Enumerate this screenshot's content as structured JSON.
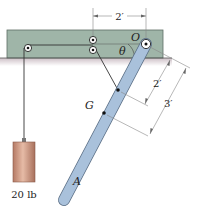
{
  "diagram": {
    "type": "mechanics-figure",
    "labels": {
      "pivot": "O",
      "center_of_mass": "G",
      "bar_end": "A",
      "angle": "θ",
      "weight": "20 lb"
    },
    "dimensions": {
      "horizontal_top": "2′",
      "bar_to_cable_attachment": "2′",
      "bar_to_G": "3′"
    },
    "colors": {
      "support_block": "#9fb5a8",
      "support_block_border": "#5e6e64",
      "ground_shadow": "#d8d0d4",
      "bar_fill": "#a9c1db",
      "bar_border": "#5a6e85",
      "weight_fill": "#c9927c",
      "weight_highlight": "#e3b8a4",
      "cable": "#333333",
      "dimension_line": "#777777"
    }
  }
}
